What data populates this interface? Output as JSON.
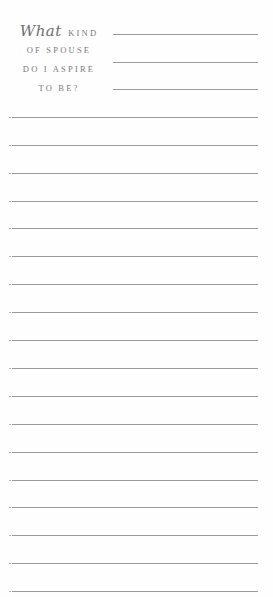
{
  "prompt": {
    "script_word": "What",
    "line1_rest": "KIND",
    "line2": "OF SPOUSE",
    "line3": "DO I ASPIRE",
    "line4": "TO BE?"
  },
  "header_rules": [
    34,
    62,
    89
  ],
  "writing_rules": [
    117,
    145,
    173,
    201,
    228,
    256,
    284,
    312,
    340,
    368,
    396,
    424,
    452,
    480,
    507,
    535,
    563,
    591
  ],
  "colors": {
    "text": "#7a7a7a",
    "rule": "#9a9a9a",
    "paper": "#fefefe"
  }
}
